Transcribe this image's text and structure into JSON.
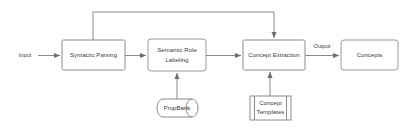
{
  "diagram": {
    "background_color": "#ffffff",
    "stroke_color": "#8a8a8a",
    "text_color": "#3c3c3c",
    "nodes": [
      {
        "id": "syntactic_parsing",
        "label": "Syntactic Parsing",
        "shape": "process"
      },
      {
        "id": "semantic_role_labeling",
        "label_line1": "Semantic Role",
        "label_line2": "Labeling",
        "shape": "process"
      },
      {
        "id": "concept_extraction",
        "label": "Concept Extraction",
        "shape": "process"
      },
      {
        "id": "concepts",
        "label": "Concepts",
        "shape": "process"
      },
      {
        "id": "propbank",
        "label": "PropBank",
        "shape": "database-cylinder"
      },
      {
        "id": "concept_templates",
        "label_line1": "Concept",
        "label_line2": "Templates",
        "shape": "predefined-process"
      }
    ],
    "edge_labels": {
      "input": "Input",
      "output": "Output"
    },
    "edges": [
      {
        "from": "input",
        "to": "syntactic_parsing",
        "label": "Input"
      },
      {
        "from": "syntactic_parsing",
        "to": "semantic_role_labeling",
        "label": ""
      },
      {
        "from": "semantic_role_labeling",
        "to": "concept_extraction",
        "label": ""
      },
      {
        "from": "concept_extraction",
        "to": "concepts",
        "label": "Output"
      },
      {
        "from": "propbank",
        "to": "semantic_role_labeling",
        "label": ""
      },
      {
        "from": "concept_templates",
        "to": "concept_extraction",
        "label": ""
      },
      {
        "from": "syntactic_parsing",
        "to": "concept_extraction",
        "label": "",
        "style": "feedback-top"
      }
    ]
  }
}
